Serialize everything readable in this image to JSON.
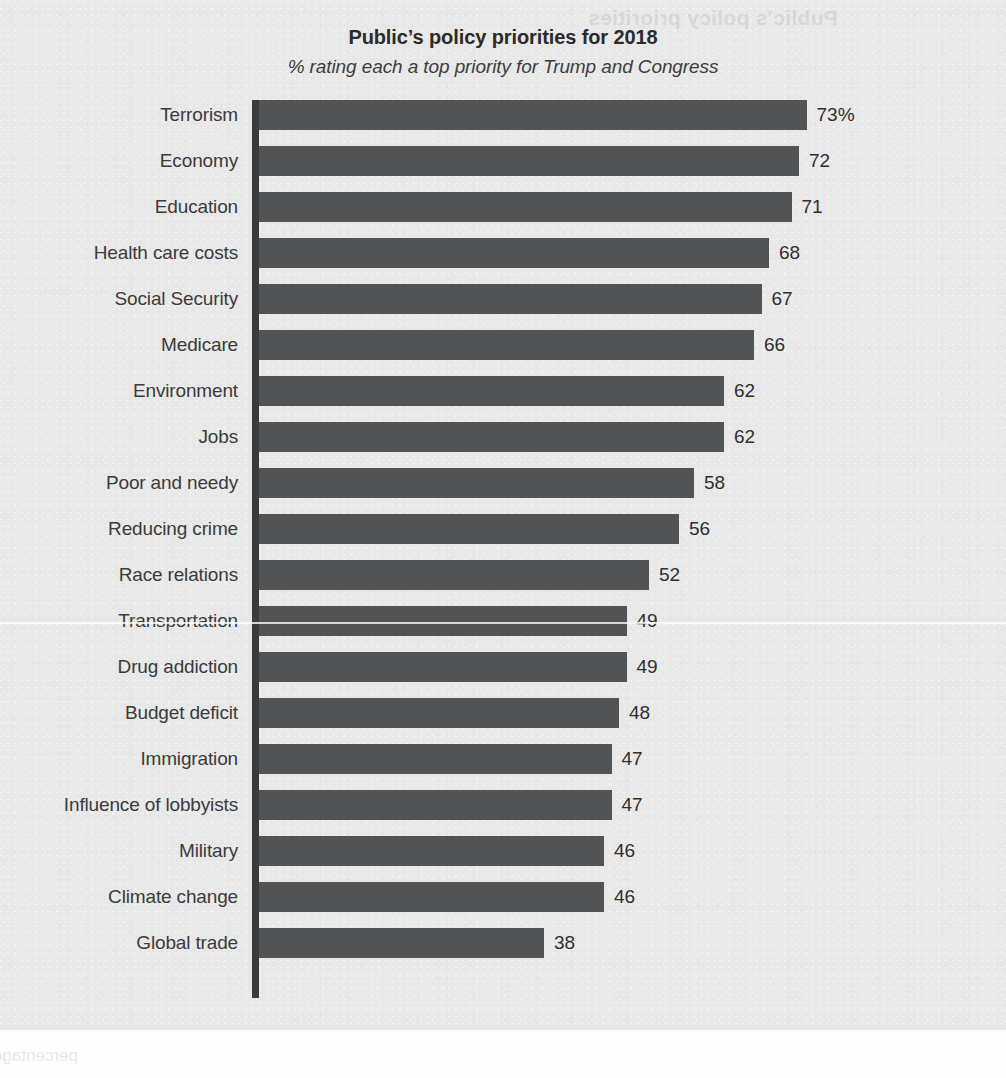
{
  "chart_data": {
    "type": "bar",
    "orientation": "horizontal",
    "title": "Public’s policy priorities for 2018",
    "subtitle": "% rating each a top priority for Trump and Congress",
    "xlabel": "",
    "ylabel": "",
    "xlim": [
      0,
      100
    ],
    "grid": false,
    "legend": null,
    "bar_color": "#515355",
    "background_color": "#e8e8e8",
    "axis_color": "#3a3b3d",
    "value_unit": "%",
    "categories": [
      "Terrorism",
      "Economy",
      "Education",
      "Health care costs",
      "Social Security",
      "Medicare",
      "Environment",
      "Jobs",
      "Poor and needy",
      "Reducing crime",
      "Race relations",
      "Transportation",
      "Drug addiction",
      "Budget deficit",
      "Immigration",
      "Influence of lobbyists",
      "Military",
      "Climate change",
      "Global trade"
    ],
    "values": [
      73,
      72,
      71,
      68,
      67,
      66,
      62,
      62,
      58,
      56,
      52,
      49,
      49,
      48,
      47,
      47,
      46,
      46,
      38
    ],
    "value_labels": [
      "73%",
      "72",
      "71",
      "68",
      "67",
      "66",
      "62",
      "62",
      "58",
      "56",
      "52",
      "49",
      "49",
      "48",
      "47",
      "47",
      "46",
      "46",
      "38"
    ]
  },
  "artifacts": {
    "ghost_top_text": "Public’s policy priorities",
    "ghost_bottom_text": "percentage of adults who say each should be a top priority"
  }
}
